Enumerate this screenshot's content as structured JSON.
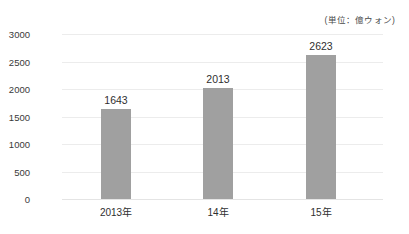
{
  "chart_data": {
    "type": "bar",
    "title": "",
    "subtitle": "",
    "unit_note": "(単位：億ウォン)",
    "categories": [
      "2013年",
      "14年",
      "15年"
    ],
    "values": [
      1643,
      2013,
      2623
    ],
    "data_labels": [
      "1643",
      "2013",
      "2623"
    ],
    "xlabel": "",
    "ylabel": "",
    "ylim": [
      0,
      3000
    ],
    "ytick_values": [
      3000,
      2500,
      2000,
      1500,
      1000,
      500,
      0
    ],
    "ytick_labels": [
      "3000",
      "2500",
      "2000",
      "1500",
      "1000",
      "500",
      "0"
    ],
    "grid": true,
    "legend": "none",
    "bar_color": "#a0a0a0",
    "grid_color": "#ececec",
    "text_color": "#2f2f2f",
    "background_color": "#ffffff"
  }
}
